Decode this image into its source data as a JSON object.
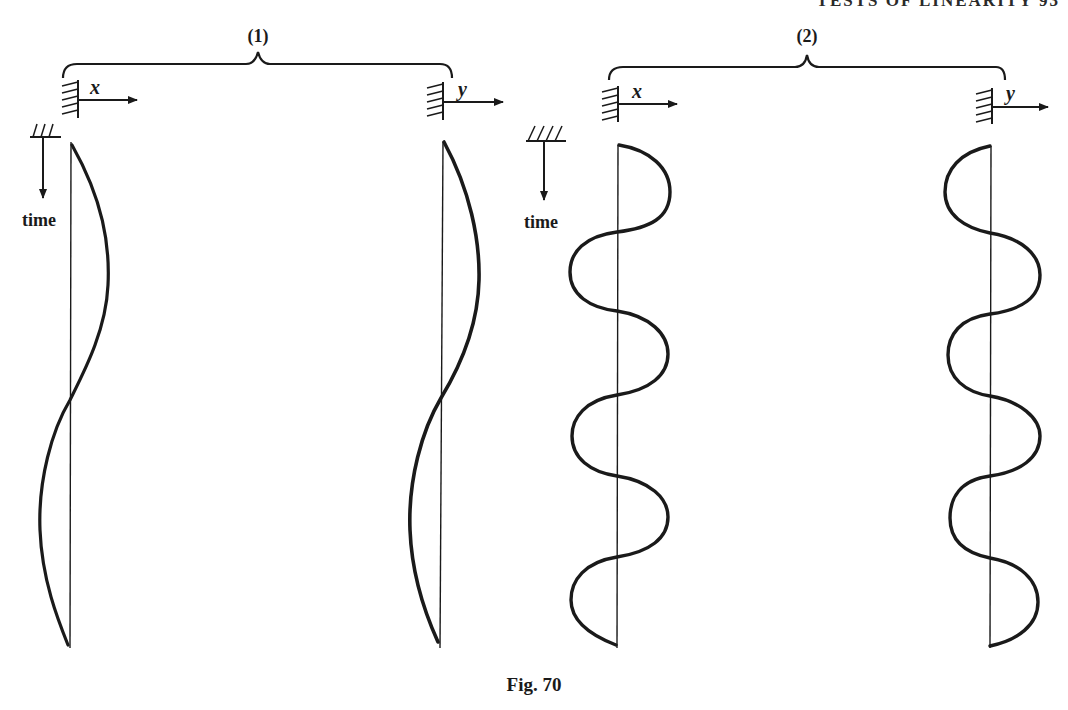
{
  "page_header": "TESTS OF LINEARITY  93",
  "caption": "Fig. 70",
  "panels": [
    {
      "id": "1",
      "label": "(1)",
      "input_axis": "x",
      "output_axis": "y",
      "time_label": "time",
      "description": "Low-frequency input x (half-cycle each way) and output y of same shape"
    },
    {
      "id": "2",
      "label": "(2)",
      "input_axis": "x",
      "output_axis": "y",
      "time_label": "time",
      "description": "Higher-frequency input x and output y, output phase-inverted"
    }
  ],
  "colors": {
    "ink": "#1a1a1a",
    "background": "#ffffff"
  }
}
